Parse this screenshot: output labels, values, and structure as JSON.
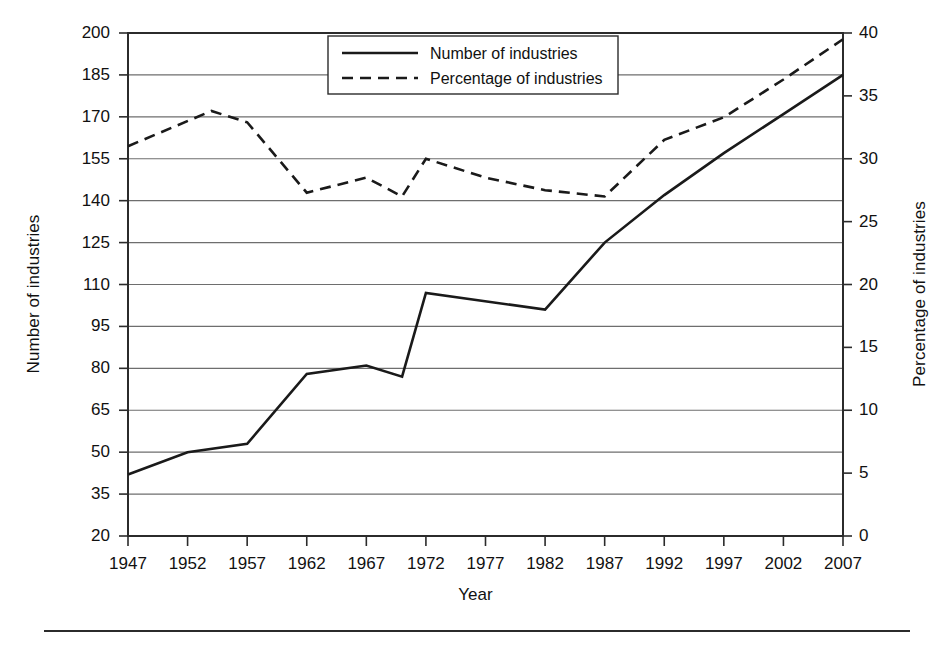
{
  "chart_data": {
    "type": "line",
    "title": "",
    "xlabel": "Year",
    "ylabel": "Number of industries",
    "y2label": "Percentage of industries",
    "x": [
      1947,
      1952,
      1954,
      1957,
      1962,
      1967,
      1970,
      1972,
      1977,
      1982,
      1987,
      1992,
      1997,
      2002,
      2007
    ],
    "xticks": [
      1947,
      1952,
      1957,
      1962,
      1967,
      1972,
      1977,
      1982,
      1987,
      1992,
      1997,
      2002,
      2007
    ],
    "yticks": [
      20,
      35,
      50,
      65,
      80,
      95,
      110,
      125,
      140,
      155,
      170,
      185,
      200
    ],
    "y2ticks": [
      0,
      5,
      10,
      15,
      20,
      25,
      30,
      35,
      40
    ],
    "ylim": [
      20,
      200
    ],
    "y2lim": [
      0,
      40
    ],
    "xlim": [
      1947,
      2007
    ],
    "grid": true,
    "legend_position": "top-center",
    "series": [
      {
        "name": "Number of industries",
        "axis": "left",
        "style": "solid",
        "color": "#1a1a1a",
        "x": [
          1947,
          1952,
          1957,
          1962,
          1967,
          1970,
          1972,
          1982,
          1987,
          1992,
          1997,
          2002,
          2007
        ],
        "values": [
          42,
          50,
          53,
          78,
          81,
          77,
          107,
          101,
          125,
          142,
          157,
          171,
          185
        ]
      },
      {
        "name": "Percentage of industries",
        "axis": "right",
        "style": "dashed",
        "color": "#1a1a1a",
        "x": [
          1947,
          1954,
          1957,
          1962,
          1967,
          1970,
          1972,
          1977,
          1982,
          1987,
          1992,
          1997,
          2002,
          2007
        ],
        "values": [
          31.0,
          33.8,
          32.9,
          27.3,
          28.5,
          27.0,
          30.0,
          28.5,
          27.5,
          27.0,
          31.5,
          33.3,
          36.3,
          39.5
        ]
      }
    ]
  },
  "legend": {
    "items": [
      {
        "label": "Number of industries",
        "style": "solid"
      },
      {
        "label": "Percentage of industries",
        "style": "dashed"
      }
    ]
  },
  "axes": {
    "left_title": "Number of industries",
    "right_title": "Percentage of industries",
    "x_title": "Year"
  }
}
